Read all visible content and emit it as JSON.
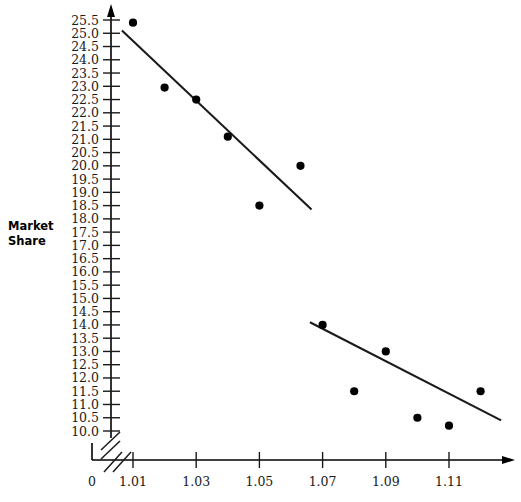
{
  "chart_data": {
    "type": "scatter",
    "title": "",
    "xlabel": "",
    "ylabel": "Market Share",
    "xlim": [
      1.0,
      1.125
    ],
    "ylim": [
      10.0,
      25.5
    ],
    "grid": false,
    "legend": false,
    "x_tick_labels": [
      "0",
      "1.01",
      "1.03",
      "1.05",
      "1.07",
      "1.09",
      "1.11"
    ],
    "y_tick_labels": [
      "25.5",
      "25.0",
      "24.5",
      "24.0",
      "23.5",
      "23.0",
      "22.5",
      "22.0",
      "21.5",
      "21.0",
      "20.5",
      "20.0",
      "19.5",
      "19.0",
      "18.5",
      "18.0",
      "17.5",
      "17.0",
      "16.5",
      "16.0",
      "15.5",
      "15.0",
      "14.5",
      "14.0",
      "13.5",
      "13.0",
      "12.5",
      "12.0",
      "11.5",
      "11.0",
      "10.5",
      "10.0"
    ],
    "axis_break_x": true,
    "axis_break_y": true,
    "series": [
      {
        "name": "upper-cluster",
        "points": [
          {
            "x": 1.01,
            "y": 25.4
          },
          {
            "x": 1.02,
            "y": 22.95
          },
          {
            "x": 1.03,
            "y": 22.5
          },
          {
            "x": 1.04,
            "y": 21.1
          },
          {
            "x": 1.05,
            "y": 18.5
          },
          {
            "x": 1.063,
            "y": 20.0
          }
        ],
        "trend_line": {
          "x1": 1.0065,
          "y1": 25.1,
          "x2": 1.0665,
          "y2": 18.35
        }
      },
      {
        "name": "lower-cluster",
        "points": [
          {
            "x": 1.07,
            "y": 14.0
          },
          {
            "x": 1.08,
            "y": 11.5
          },
          {
            "x": 1.09,
            "y": 13.0
          },
          {
            "x": 1.1,
            "y": 10.5
          },
          {
            "x": 1.11,
            "y": 10.2
          },
          {
            "x": 1.12,
            "y": 11.5
          }
        ],
        "trend_line": {
          "x1": 1.066,
          "y1": 14.1,
          "x2": 1.1265,
          "y2": 10.4
        }
      }
    ]
  },
  "axes": {
    "y_title_line1": "Market",
    "y_title_line2": "Share",
    "x_zero_label": "0"
  }
}
